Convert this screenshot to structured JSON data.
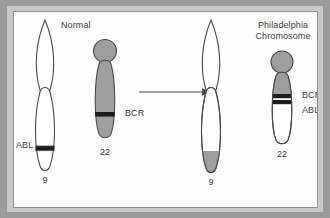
{
  "figure": {
    "type": "diagram",
    "background_color": "#fdfdfd",
    "frame_color": "#9a9a9a",
    "outline_color": "#4a4a4a",
    "band_color": "#1c1c1c",
    "fill_grey": "#9e9e9e",
    "fill_white": "#ffffff"
  },
  "panels": {
    "left": {
      "title": "Normal",
      "chromosomes": [
        {
          "id": "normal-9",
          "number_label": "9",
          "fill": "white",
          "gene_label": "ABL",
          "gene_label_side": "left",
          "band_position": "lower long arm"
        },
        {
          "id": "normal-22",
          "number_label": "22",
          "fill": "grey",
          "gene_label": "BCR",
          "gene_label_side": "right",
          "band_position": "lower long arm"
        }
      ]
    },
    "right": {
      "title_line1": "Philadelphia",
      "title_line2": "Chromosome",
      "chromosomes": [
        {
          "id": "der-9",
          "number_label": "9",
          "fill": "white",
          "tip_fill": "grey",
          "gene_label": "",
          "band_position": "grey translocated tip at distal long arm"
        },
        {
          "id": "ph-22",
          "number_label": "22",
          "fill": "grey-top-white-bottom",
          "gene_labels": [
            "BCR",
            "ABL"
          ],
          "gene_label_side": "right",
          "band_position": "two adjacent dark bands at fusion point"
        }
      ]
    }
  },
  "arrow": {
    "name": "translocation-arrow",
    "direction": "left-to-right",
    "color": "#4a4a4a"
  }
}
